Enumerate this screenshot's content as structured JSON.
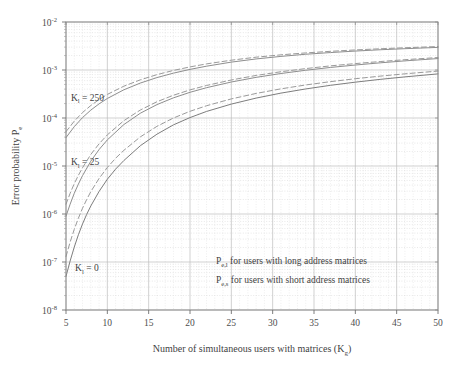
{
  "chart_data": {
    "type": "line",
    "title": "",
    "xlabel": "Number of simultaneous users with matrices (K",
    "xlabel_sub": "g",
    "xlabel_close": ")",
    "ylabel": "Error probability P",
    "ylabel_sub": "e",
    "xlim": [
      5,
      50
    ],
    "ylim": [
      1e-08,
      0.01
    ],
    "yscale": "log",
    "grid": true,
    "grid_style": "dotted minor + solid major",
    "legend_position": "inside-bottom-right",
    "xticks": [
      5,
      10,
      15,
      20,
      25,
      30,
      35,
      40,
      45,
      50
    ],
    "yticks": [
      "10-2",
      "10-3",
      "10-4",
      "10-5",
      "10-6",
      "10-7",
      "10-8"
    ],
    "ytick_mantissa": "10",
    "ytick_exponents": [
      "-2",
      "-3",
      "-4",
      "-5",
      "-6",
      "-7",
      "-8"
    ],
    "annotations": [
      {
        "text": "K",
        "sub": "l",
        "rest": " = 250",
        "x": 5.6,
        "y": 0.00023,
        "name": "annotation-kl-250"
      },
      {
        "text": "K",
        "sub": "l",
        "rest": " = 25",
        "x": 5.6,
        "y": 1.05e-05,
        "name": "annotation-kl-25"
      },
      {
        "text": "K",
        "sub": "l",
        "rest": " = 0",
        "x": 6.1,
        "y": 6.5e-08,
        "name": "annotation-kl-0"
      }
    ],
    "legend": [
      {
        "symbol": "P",
        "sub": "e,l",
        "label": " for users with long address matrices",
        "style": "dashed",
        "color": "#8a8a8a"
      },
      {
        "symbol": "P",
        "sub": "e,s",
        "label": " for users with short address matrices",
        "style": "solid",
        "color": "#7a7a7a"
      }
    ],
    "series": [
      {
        "name": "Pe,l  Kl = 250",
        "group": "Kl=250",
        "style": "dashed",
        "color": "#9a9a9a",
        "x": [
          5,
          6,
          7,
          8,
          9,
          10,
          12,
          14,
          16,
          18,
          20,
          22,
          25,
          28,
          31,
          34,
          37,
          40,
          43,
          46,
          50
        ],
        "y": [
          5.2e-05,
          8.6e-05,
          0.00013,
          0.000182,
          0.000242,
          0.00031,
          0.00046,
          0.000625,
          0.0008,
          0.00098,
          0.00116,
          0.00134,
          0.0016,
          0.00185,
          0.00207,
          0.00227,
          0.00245,
          0.00262,
          0.00277,
          0.00291,
          0.00308
        ]
      },
      {
        "name": "Pe,s  Kl = 250",
        "group": "Kl=250",
        "style": "solid",
        "color": "#8e8e8e",
        "x": [
          5,
          6,
          7,
          8,
          9,
          10,
          12,
          14,
          16,
          18,
          20,
          22,
          25,
          28,
          31,
          34,
          37,
          40,
          43,
          46,
          50
        ],
        "y": [
          3.9e-05,
          6.6e-05,
          0.000102,
          0.000146,
          0.000197,
          0.000255,
          0.000387,
          0.000535,
          0.000695,
          0.00086,
          0.00103,
          0.0012,
          0.00146,
          0.0017,
          0.00192,
          0.00213,
          0.00231,
          0.00248,
          0.00264,
          0.00278,
          0.00296
        ]
      },
      {
        "name": "Pe,l  Kl = 25",
        "group": "Kl=25",
        "style": "dashed",
        "color": "#9a9a9a",
        "x": [
          5,
          5.5,
          6,
          6.5,
          7,
          8,
          9,
          10,
          12,
          14,
          16,
          18,
          20,
          22,
          25,
          28,
          31,
          34,
          37,
          40,
          43,
          46,
          50
        ],
        "y": [
          1.6e-06,
          2.7e-06,
          4.3e-06,
          6.4e-06,
          9.2e-06,
          1.74e-05,
          2.9e-05,
          4.45e-05,
          8.8e-05,
          0.000147,
          0.000218,
          0.000298,
          0.000385,
          0.000476,
          0.00062,
          0.00077,
          0.00092,
          0.00107,
          0.00122,
          0.00136,
          0.0015,
          0.00164,
          0.00182
        ]
      },
      {
        "name": "Pe,s  Kl = 25",
        "group": "Kl=25",
        "style": "solid",
        "color": "#8e8e8e",
        "x": [
          5,
          5.5,
          6,
          6.5,
          7,
          8,
          9,
          10,
          12,
          14,
          16,
          18,
          20,
          22,
          25,
          28,
          31,
          34,
          37,
          40,
          43,
          46,
          50
        ],
        "y": [
          9e-07,
          1.6e-06,
          2.7e-06,
          4.2e-06,
          6.3e-06,
          1.26e-05,
          2.2e-05,
          3.5e-05,
          7.3e-05,
          0.000126,
          0.00019,
          0.000263,
          0.000343,
          0.000428,
          0.000562,
          0.000703,
          0.000845,
          0.000988,
          0.00113,
          0.00127,
          0.00141,
          0.00155,
          0.00173
        ]
      },
      {
        "name": "Pe,l  Kl = 0",
        "group": "Kl=0",
        "style": "dashed",
        "color": "#9a9a9a",
        "x": [
          5,
          5.5,
          6,
          6.5,
          7,
          7.5,
          8,
          9,
          10,
          11,
          12,
          14,
          16,
          18,
          20,
          22,
          25,
          28,
          31,
          34,
          37,
          40,
          43,
          46,
          50
        ],
        "y": [
          1.3e-07,
          2.6e-07,
          4.8e-07,
          8.2e-07,
          1.32e-06,
          2e-06,
          2.92e-06,
          5.5e-06,
          9.3e-06,
          1.45e-05,
          2.12e-05,
          4.05e-05,
          6.7e-05,
          0.0001,
          0.000138,
          0.00018,
          0.00025,
          0.000325,
          0.000405,
          0.000488,
          0.000572,
          0.000658,
          0.000745,
          0.000832,
          0.00095
        ]
      },
      {
        "name": "Pe,s  Kl = 0",
        "group": "Kl=0",
        "style": "solid",
        "color": "#7d7d7d",
        "x": [
          5,
          5.5,
          6,
          6.5,
          7,
          7.5,
          8,
          9,
          10,
          11,
          12,
          14,
          16,
          18,
          20,
          22,
          25,
          28,
          31,
          34,
          37,
          40,
          43,
          46,
          50
        ],
        "y": [
          5e-08,
          1.05e-07,
          2.05e-07,
          3.7e-07,
          6.2e-07,
          9.8e-07,
          1.47e-06,
          2.95e-06,
          5.3e-06,
          8.6e-06,
          1.3e-05,
          2.65e-05,
          4.6e-05,
          7.2e-05,
          0.000102,
          0.000137,
          0.000195,
          0.00026,
          0.00033,
          0.000403,
          0.00048,
          0.000558,
          0.000638,
          0.000719,
          0.00083
        ]
      }
    ]
  },
  "figure": {
    "background": "#ffffff",
    "axis_color": "#8b8b8b",
    "grid_color": "#cfcfcf",
    "text_color": "#444444"
  }
}
